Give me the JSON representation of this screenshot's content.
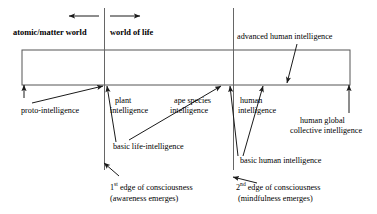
{
  "diagram": {
    "colors": {
      "stroke": "#222222",
      "text": "#000000",
      "background": "#ffffff"
    },
    "axis_labels": {
      "left_world": "atomic/matter world",
      "right_world": "world of life"
    },
    "arrows_top": {
      "left_arrow": "left-arrow",
      "right_arrow": "right-arrow"
    },
    "labels": {
      "proto_intelligence": "proto-intelligence",
      "plant_intelligence_line1": "plant",
      "plant_intelligence_line2": "intelligence",
      "ape_species_line1": "ape species",
      "ape_species_line2": "intelligence",
      "human_intelligence_line1": "human",
      "human_intelligence_line2": "intelligence",
      "advanced_human_intelligence": "advanced human intelligence",
      "human_global_line1": "human global",
      "human_global_line2": "collective intelligence",
      "basic_life_intelligence": "basic life-intelligence",
      "basic_human_intelligence": "basic human intelligence"
    },
    "edges": {
      "first_edge_ordinal": "1",
      "first_edge_suffix": "st",
      "first_edge_text": " edge of consciousness",
      "first_edge_sub": "(awareness emerges)",
      "second_edge_ordinal": "2",
      "second_edge_suffix": "nd",
      "second_edge_text": " edge of consciousness",
      "second_edge_sub": "(mindfulness emerges)"
    },
    "geometry": {
      "box_left": 22,
      "box_right": 350,
      "box_top": 50,
      "box_bottom": 85,
      "divider_1_x": 104,
      "divider_2_x": 233,
      "divider_top_y": 8,
      "divider_bottom_y": 170
    }
  }
}
